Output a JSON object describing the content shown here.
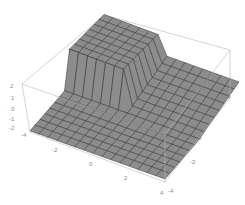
{
  "chart_data": {
    "type": "surface3d",
    "title": "",
    "xlabel": "",
    "ylabel": "",
    "zlabel": "",
    "x_ticks": [
      "-2",
      "0",
      "2",
      "4"
    ],
    "y_ticks": [
      "-4",
      "-2",
      "0",
      "2",
      "4"
    ],
    "z_ticks": [
      "2",
      "1",
      "0",
      "-1",
      "-2",
      "-4"
    ],
    "x_range": [
      -4,
      4
    ],
    "y_range": [
      -4,
      4
    ],
    "z_range": [
      -2,
      2
    ],
    "grid_mesh": 15,
    "box": true,
    "surface_color": "#8c8c8c",
    "mesh_color": "#333333",
    "frame_color": "#b8b8b8"
  },
  "labels": {
    "z": [
      {
        "text": "2",
        "x": 10,
        "y": 88
      },
      {
        "text": "1",
        "x": 11,
        "y": 100
      },
      {
        "text": "0",
        "x": 11,
        "y": 111
      },
      {
        "text": "-1",
        "x": 9,
        "y": 121
      },
      {
        "text": "-2",
        "x": 9,
        "y": 130
      },
      {
        "text": "-4",
        "x": 21,
        "y": 137
      }
    ],
    "x": [
      {
        "text": "-2",
        "x": 52,
        "y": 152
      },
      {
        "text": "0",
        "x": 89,
        "y": 166
      },
      {
        "text": "2",
        "x": 124,
        "y": 180
      },
      {
        "text": "4",
        "x": 160,
        "y": 195
      }
    ],
    "y": [
      {
        "text": "-4",
        "x": 168,
        "y": 193
      },
      {
        "text": "-2",
        "x": 190,
        "y": 164
      },
      {
        "text": "0",
        "x": 198,
        "y": 140
      },
      {
        "text": "2",
        "x": 212,
        "y": 116
      },
      {
        "text": "4",
        "x": 227,
        "y": 99
      }
    ]
  }
}
